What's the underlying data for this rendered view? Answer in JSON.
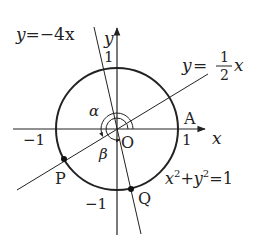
{
  "diagram": {
    "type": "unit-circle-angle-figure",
    "axes": {
      "x_label": "x",
      "y_label": "y",
      "origin_label": "O",
      "tick_labels": {
        "x_pos": "1",
        "x_neg": "−1",
        "y_pos": "1",
        "y_neg": "−1"
      }
    },
    "circle": {
      "equation": "x²+y²=1",
      "eq_x": "x",
      "eq_y": "y",
      "eq_sup": "2",
      "eq_plus": "+",
      "eq_rhs": "=1"
    },
    "lines": [
      {
        "id": "line-neg4x",
        "equation": "y=−4x",
        "lhs": "y",
        "rhs": "=−4x"
      },
      {
        "id": "line-half-x",
        "equation": "y=½x",
        "lhs": "y",
        "eq": "=",
        "num": "1",
        "den": "2",
        "var": "x"
      }
    ],
    "points": [
      {
        "label": "A",
        "description": "(1, 0)"
      },
      {
        "label": "P",
        "description": "intersection of y=½x with circle, third quadrant"
      },
      {
        "label": "Q",
        "description": "intersection of y=−4x with circle, fourth quadrant"
      }
    ],
    "angles": [
      {
        "label": "α",
        "from": "OA",
        "to": "OP",
        "direction": "counterclockwise"
      },
      {
        "label": "β",
        "from": "OA",
        "to": "OQ",
        "direction": "counterclockwise"
      }
    ],
    "colors": {
      "ink": "#222222",
      "background": "#ffffff"
    }
  }
}
